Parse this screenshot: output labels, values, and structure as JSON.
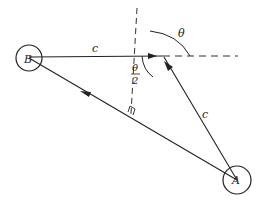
{
  "diagram": {
    "type": "geometry",
    "nodes": [
      {
        "id": "B",
        "label": "B",
        "cx": 29,
        "cy": 58,
        "r": 13
      },
      {
        "id": "A",
        "label": "A",
        "cx": 237,
        "cy": 180,
        "r": 14
      }
    ],
    "point_P": {
      "x": 163,
      "y": 56
    },
    "edges": [
      {
        "from": "B",
        "to": "P",
        "label": "c",
        "style": "solid",
        "arrow": "toward P"
      },
      {
        "from": "A",
        "to": "P",
        "label": "c",
        "style": "solid",
        "arrow": "toward P"
      },
      {
        "from": "A",
        "to": "B",
        "label": "",
        "style": "solid",
        "arrow": "toward B"
      }
    ],
    "construction_lines": [
      {
        "name": "horizontal-extension",
        "style": "dashed"
      },
      {
        "name": "bisector-perpendicular",
        "style": "dashed",
        "marker": "right-angle at A–B line"
      }
    ],
    "angles": [
      {
        "label": "θ",
        "position": "between dashed vertical-ish line and horizontal extension"
      },
      {
        "label_num": "θ",
        "label_den": "2",
        "position": "between line BP and perpendicular bisector"
      }
    ],
    "labels": {
      "B": "B",
      "A": "A",
      "c_top": "c",
      "c_right": "c",
      "theta": "θ",
      "half_theta_num": "θ",
      "half_theta_den": "2"
    }
  }
}
